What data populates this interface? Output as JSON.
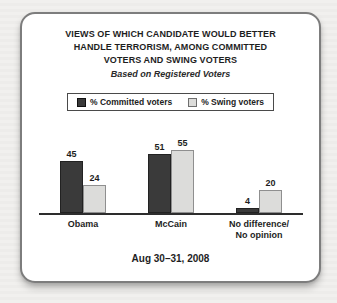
{
  "title": {
    "lines": [
      "VIEWS OF WHICH CANDIDATE WOULD BETTER",
      "HANDLE TERRORISM, AMONG COMMITTED",
      "VOTERS AND SWING VOTERS"
    ],
    "subtitle": "Based on Registered Voters"
  },
  "legend": {
    "items": [
      {
        "label": "% Committed voters",
        "color": "#3a3a3a"
      },
      {
        "label": "% Swing voters",
        "color": "#dcdcda"
      }
    ]
  },
  "chart_data": {
    "type": "bar",
    "categories": [
      "Obama",
      "McCain",
      "No difference/ No opinion"
    ],
    "categories_lines": [
      [
        "Obama"
      ],
      [
        "McCain"
      ],
      [
        "No difference/",
        "No opinion"
      ]
    ],
    "series": [
      {
        "name": "% Committed voters",
        "values": [
          45,
          51,
          4
        ],
        "color": "#3a3a3a"
      },
      {
        "name": "% Swing voters",
        "values": [
          24,
          55,
          20
        ],
        "color": "#dcdcda"
      }
    ],
    "title": "VIEWS OF WHICH CANDIDATE WOULD BETTER HANDLE TERRORISM, AMONG COMMITTED VOTERS AND SWING VOTERS",
    "subtitle": "Based on Registered Voters",
    "xlabel": "",
    "ylabel": "",
    "ylim": [
      0,
      60
    ],
    "grid": false,
    "legend_position": "top",
    "axis_color": "#2d2d2d",
    "footer_date": "Aug 30–31, 2008"
  },
  "footer": {
    "date": "Aug 30–31, 2008"
  }
}
